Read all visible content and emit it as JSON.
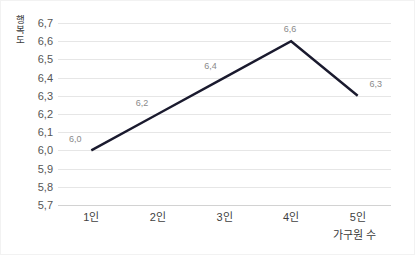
{
  "chart_data": {
    "type": "line",
    "title": "",
    "subtitle": "",
    "xlabel": "가구원 수",
    "ylabel": "행복도",
    "categories": [
      "1인",
      "2인",
      "3인",
      "4인",
      "5인"
    ],
    "values": [
      6.0,
      6.2,
      6.4,
      6.6,
      6.3
    ],
    "data_labels": [
      "6,0",
      "6,2",
      "6,4",
      "6,6",
      "6,3"
    ],
    "ylim": [
      5.7,
      6.7
    ],
    "ytick_labels": [
      "6,7",
      "6,6",
      "6,5",
      "6,4",
      "6,3",
      "6,2",
      "6,1",
      "6,0",
      "5,9",
      "5,8",
      "5,7"
    ],
    "ytick_values": [
      6.7,
      6.6,
      6.5,
      6.4,
      6.3,
      6.2,
      6.1,
      6.0,
      5.9,
      5.8,
      5.7
    ],
    "grid": true,
    "legend": false,
    "legend_position": "none",
    "series": [
      {
        "name": "행복도",
        "values": [
          6.0,
          6.2,
          6.4,
          6.6,
          6.3
        ],
        "color": "#1a1a2e"
      }
    ],
    "colors": {
      "line": "#1a1a2e",
      "gridline": "#e6e6e6",
      "axis_line": "#d2d2d2",
      "tick_text": "#565656",
      "label_text": "#8a8a8a",
      "background": "#ffffff",
      "border": "#f2f2f2"
    }
  }
}
